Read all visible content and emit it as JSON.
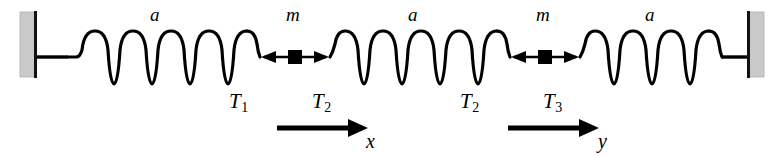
{
  "figure": {
    "colors": {
      "ink": "#000000",
      "wall_fill": "#c8c8c8",
      "wall_edge": "#1a1a1a",
      "background": "#ffffff"
    }
  },
  "springs": [
    {
      "id": "spring-left",
      "length_label": "a",
      "coils": 6
    },
    {
      "id": "spring-middle",
      "length_label": "a",
      "coils": 6
    },
    {
      "id": "spring-right",
      "length_label": "a",
      "coils": 6
    }
  ],
  "masses": [
    {
      "id": "mass-left",
      "label": "m"
    },
    {
      "id": "mass-right",
      "label": "m"
    }
  ],
  "tensions": [
    {
      "id": "tension-1",
      "symbol": "T",
      "subscript": "1"
    },
    {
      "id": "tension-2-left",
      "symbol": "T",
      "subscript": "2"
    },
    {
      "id": "tension-2-right",
      "symbol": "T",
      "subscript": "2"
    },
    {
      "id": "tension-3",
      "symbol": "T",
      "subscript": "3"
    }
  ],
  "coordinates": [
    {
      "id": "displacement-x",
      "label": "x"
    },
    {
      "id": "displacement-y",
      "label": "y"
    }
  ],
  "walls": [
    {
      "id": "wall-left"
    },
    {
      "id": "wall-right"
    }
  ]
}
